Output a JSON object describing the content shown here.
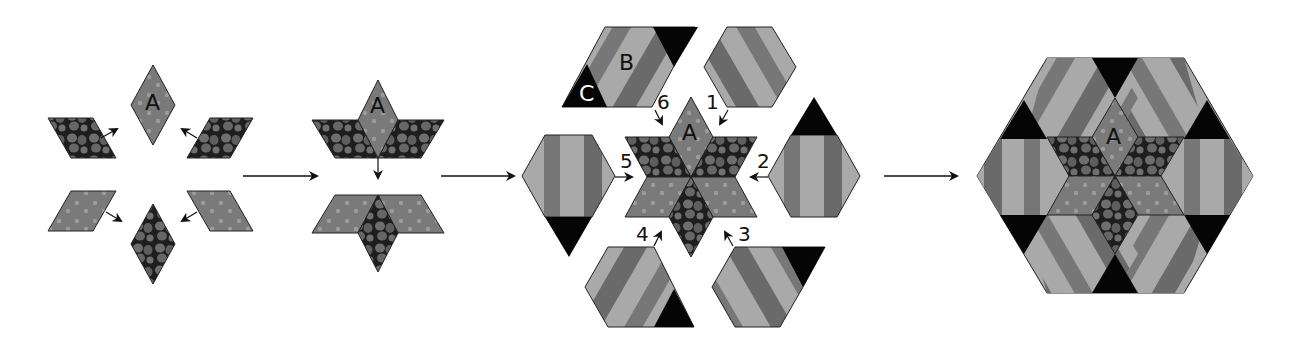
{
  "diagram": {
    "stages": [
      {
        "id": "stage-1",
        "description": "Six diamonds (A center top, rock print and dot print) arranged with arrows toward center"
      },
      {
        "id": "stage-2",
        "description": "Diamonds joined into two half-star units, top half moves down to join bottom half"
      },
      {
        "id": "stage-3",
        "description": "Completed star with six striped B pieces with black C triangles attached in order 1-6"
      },
      {
        "id": "stage-4",
        "description": "Finished hexagon block"
      }
    ],
    "labels": {
      "a": "A",
      "b": "B",
      "c": "C"
    },
    "sequence_numbers": [
      "1",
      "2",
      "3",
      "4",
      "5",
      "6"
    ],
    "colors": {
      "background": "#ffffff",
      "dot_fabric": "#7a7a7a",
      "dot": "#9a9a9a",
      "rock_dark": "#1e1e1e",
      "rock_light": "#6e6e6e",
      "stripe_light": "#a9a9a9",
      "stripe_dark": "#6a6a6a",
      "triangle": "#050505",
      "outline": "#222222",
      "arrow": "#111111"
    }
  }
}
